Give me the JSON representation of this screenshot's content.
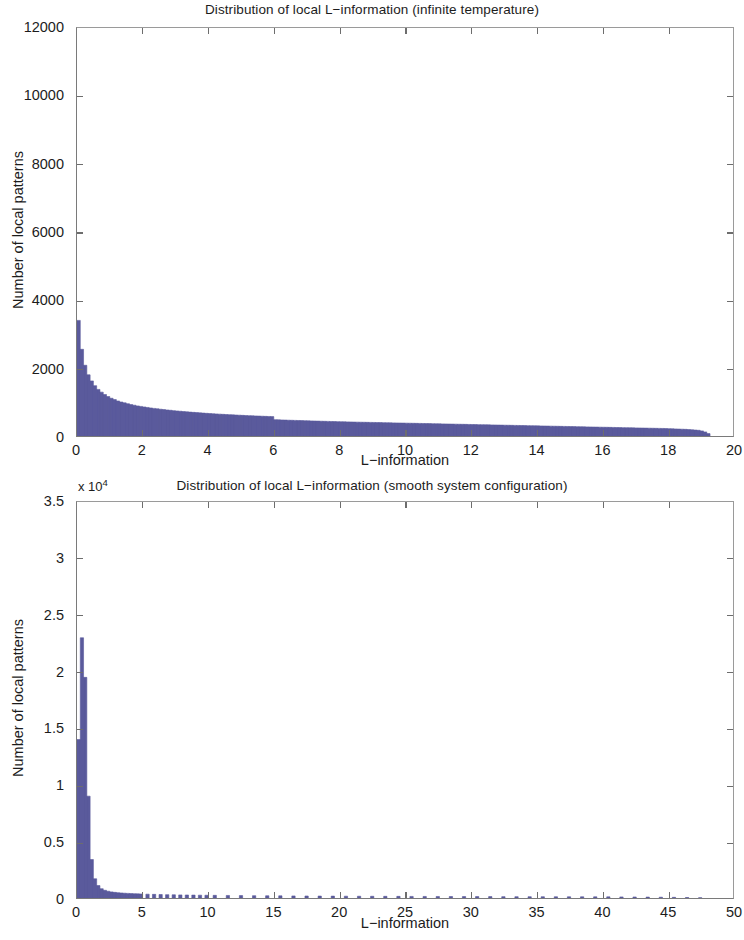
{
  "figure": {
    "width": 744,
    "height": 940,
    "background": "#ffffff",
    "bar_color": "#5a5a9c",
    "axis_color": "#7a7a7a",
    "text_color": "#1c1c1c"
  },
  "panels": [
    {
      "id": "infinite-temperature",
      "title": "Distribution of local L−information (infinite temperature)",
      "xlabel": "L−information",
      "ylabel": "Number of local patterns",
      "exponent": null,
      "yticks": [
        "0",
        "2000",
        "4000",
        "6000",
        "8000",
        "10000",
        "12000"
      ],
      "ytick_values": [
        0,
        2000,
        4000,
        6000,
        8000,
        10000,
        12000
      ],
      "xticks": [
        "0",
        "2",
        "4",
        "6",
        "8",
        "10",
        "12",
        "14",
        "16",
        "18",
        "20"
      ],
      "xtick_values": [
        0,
        2,
        4,
        6,
        8,
        10,
        12,
        14,
        16,
        18,
        20
      ],
      "xlim": [
        0,
        20
      ],
      "ylim": [
        0,
        12000
      ]
    },
    {
      "id": "smooth-system-configuration",
      "title": "Distribution of local L−information (smooth system configuration)",
      "xlabel": "L−information",
      "ylabel": "Number of local patterns",
      "exponent": "x 10",
      "exponent_power": "4",
      "yticks": [
        "0",
        "0.5",
        "1",
        "1.5",
        "2",
        "2.5",
        "3",
        "3.5"
      ],
      "ytick_values": [
        0,
        0.5,
        1,
        1.5,
        2,
        2.5,
        3,
        3.5
      ],
      "xticks": [
        "0",
        "5",
        "10",
        "15",
        "20",
        "25",
        "30",
        "35",
        "40",
        "45",
        "50"
      ],
      "xtick_values": [
        0,
        5,
        10,
        15,
        20,
        25,
        30,
        35,
        40,
        45,
        50
      ],
      "xlim": [
        0,
        50
      ],
      "ylim": [
        0,
        3.5
      ]
    }
  ],
  "chart_data": [
    {
      "type": "bar",
      "id": "infinite-temperature",
      "title": "Distribution of local L−information (infinite temperature)",
      "xlabel": "L−information",
      "ylabel": "Number of local patterns",
      "xlim": [
        0,
        20
      ],
      "ylim": [
        0,
        12000
      ],
      "grid": false,
      "legend": null,
      "bin_width": 0.1,
      "x": [
        0.05,
        0.15,
        0.25,
        0.35,
        0.45,
        0.55,
        0.65,
        0.75,
        0.85,
        0.95,
        1.05,
        1.15,
        1.25,
        1.35,
        1.45,
        1.55,
        1.65,
        1.75,
        1.85,
        1.95,
        2.05,
        2.15,
        2.25,
        2.35,
        2.45,
        2.55,
        2.65,
        2.75,
        2.85,
        2.95,
        3.05,
        3.15,
        3.25,
        3.35,
        3.45,
        3.55,
        3.65,
        3.75,
        3.85,
        3.95,
        4.05,
        4.15,
        4.25,
        4.35,
        4.45,
        4.55,
        4.65,
        4.75,
        4.85,
        4.95,
        5.05,
        5.15,
        5.25,
        5.35,
        5.45,
        5.55,
        5.65,
        5.75,
        5.85,
        5.95,
        6.05,
        6.15,
        6.25,
        6.35,
        6.45,
        6.55,
        6.65,
        6.75,
        6.85,
        6.95,
        7.05,
        7.15,
        7.25,
        7.35,
        7.45,
        7.55,
        7.65,
        7.75,
        7.85,
        7.95,
        8.05,
        8.15,
        8.25,
        8.35,
        8.45,
        8.55,
        8.65,
        8.75,
        8.85,
        8.95,
        9.05,
        9.15,
        9.25,
        9.35,
        9.45,
        9.55,
        9.65,
        9.75,
        9.85,
        9.95,
        10.05,
        10.15,
        10.25,
        10.35,
        10.45,
        10.55,
        10.65,
        10.75,
        10.85,
        10.95,
        11.05,
        11.15,
        11.25,
        11.35,
        11.45,
        11.55,
        11.65,
        11.75,
        11.85,
        11.95,
        12.05,
        12.15,
        12.25,
        12.35,
        12.45,
        12.55,
        12.65,
        12.75,
        12.85,
        12.95,
        13.05,
        13.15,
        13.25,
        13.35,
        13.45,
        13.55,
        13.65,
        13.75,
        13.85,
        13.95,
        14.05,
        14.15,
        14.25,
        14.35,
        14.45,
        14.55,
        14.65,
        14.75,
        14.85,
        14.95,
        15.05,
        15.15,
        15.25,
        15.35,
        15.45,
        15.55,
        15.65,
        15.75,
        15.85,
        15.95,
        16.05,
        16.15,
        16.25,
        16.35,
        16.45,
        16.55,
        16.65,
        16.75,
        16.85,
        16.95,
        17.05,
        17.15,
        17.25,
        17.35,
        17.45,
        17.55,
        17.65,
        17.75,
        17.85,
        17.95,
        18.05,
        18.15,
        18.25,
        18.35,
        18.45,
        18.55,
        18.65,
        18.75,
        18.85,
        18.95,
        19.05,
        19.15,
        19.25
      ],
      "values": [
        3400,
        2550,
        2080,
        1800,
        1620,
        1480,
        1370,
        1290,
        1220,
        1160,
        1110,
        1070,
        1030,
        1000,
        975,
        950,
        925,
        905,
        885,
        870,
        855,
        840,
        825,
        812,
        800,
        788,
        777,
        766,
        756,
        746,
        737,
        728,
        719,
        711,
        703,
        695,
        688,
        681,
        674,
        667,
        661,
        655,
        649,
        643,
        637,
        632,
        627,
        622,
        617,
        612,
        607,
        602,
        598,
        594,
        590,
        586,
        582,
        578,
        574,
        570,
        480,
        476,
        472,
        469,
        465,
        462,
        459,
        456,
        453,
        450,
        447,
        444,
        441,
        438,
        435,
        432,
        430,
        427,
        425,
        422,
        420,
        417,
        415,
        413,
        410,
        408,
        406,
        404,
        402,
        400,
        398,
        396,
        394,
        392,
        390,
        388,
        386,
        384,
        382,
        380,
        378,
        376,
        374,
        372,
        370,
        368,
        366,
        364,
        362,
        360,
        358,
        356,
        354,
        352,
        350,
        348,
        346,
        344,
        342,
        340,
        338,
        336,
        334,
        332,
        330,
        328,
        326,
        324,
        322,
        320,
        318,
        316,
        314,
        312,
        310,
        308,
        306,
        304,
        302,
        300,
        298,
        296,
        294,
        292,
        290,
        288,
        286,
        284,
        282,
        280,
        278,
        276,
        274,
        272,
        270,
        268,
        266,
        264,
        262,
        260,
        258,
        256,
        254,
        252,
        250,
        248,
        246,
        244,
        242,
        240,
        238,
        236,
        234,
        232,
        230,
        228,
        226,
        224,
        222,
        220,
        216,
        212,
        208,
        204,
        200,
        196,
        190,
        184,
        176,
        168,
        150,
        120,
        70
      ]
    },
    {
      "type": "bar",
      "id": "smooth-system-configuration",
      "title": "Distribution of local L−information (smooth system configuration)",
      "xlabel": "L−information",
      "ylabel": "Number of local patterns",
      "y_exponent": 10000,
      "xlim": [
        0,
        50
      ],
      "ylim": [
        0,
        35000
      ],
      "grid": false,
      "legend": null,
      "bin_width": 0.25,
      "x": [
        0.125,
        0.375,
        0.625,
        0.875,
        1.125,
        1.375,
        1.625,
        1.875,
        2.125,
        2.375,
        2.625,
        2.875,
        3.125,
        3.375,
        3.625,
        3.875,
        4.125,
        4.375,
        4.625,
        4.875,
        5.375,
        5.875,
        6.375,
        6.875,
        7.375,
        7.875,
        8.375,
        8.875,
        9.375,
        9.875,
        10.5,
        11.5,
        12.5,
        13.5,
        14.5,
        15.5,
        16.5,
        17.5,
        18.5,
        19.5,
        20.5,
        21.5,
        22.5,
        23.5,
        24.5,
        25.5,
        26.5,
        27.5,
        28.5,
        29.5,
        30.5,
        31.5,
        32.5,
        33.5,
        34.5,
        35.5,
        36.5,
        37.5,
        38.5,
        39.5,
        40.5,
        41.5,
        42.5,
        43.5,
        44.5,
        45.5,
        46.5,
        47.5
      ],
      "values": [
        14000,
        23000,
        19500,
        9000,
        3400,
        1700,
        1100,
        820,
        680,
        600,
        540,
        500,
        470,
        445,
        425,
        408,
        392,
        378,
        366,
        355,
        338,
        322,
        308,
        296,
        285,
        275,
        266,
        258,
        251,
        244,
        235,
        224,
        214,
        205,
        197,
        190,
        183,
        177,
        171,
        166,
        161,
        156,
        152,
        148,
        144,
        140,
        137,
        134,
        131,
        128,
        125,
        122,
        120,
        117,
        115,
        112,
        110,
        108,
        105,
        103,
        100,
        96,
        90,
        82,
        72,
        60,
        44,
        24
      ]
    }
  ]
}
